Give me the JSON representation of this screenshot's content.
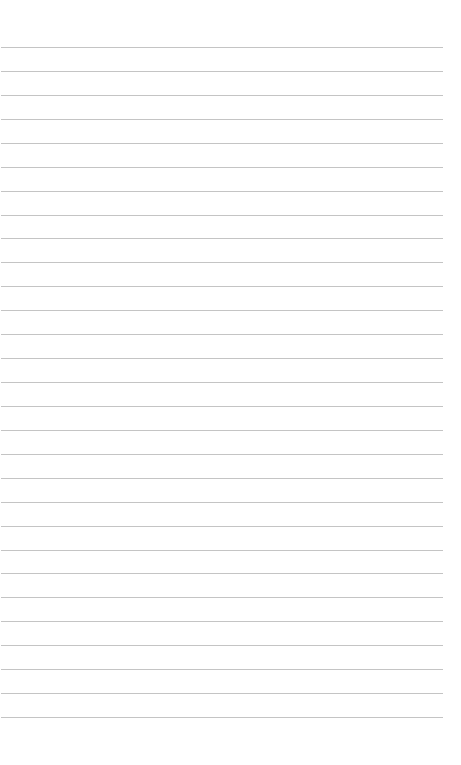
{
  "page": {
    "type": "lined-paper",
    "background": "#ffffff",
    "line_color": "#c4c4c4",
    "line_count": 29,
    "first_line_y": 47,
    "line_spacing": 23.93,
    "line_left": 1,
    "line_width": 442
  }
}
